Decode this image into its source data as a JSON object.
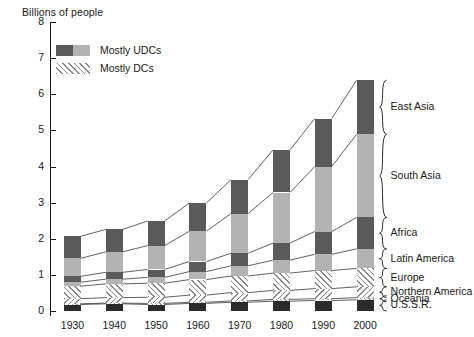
{
  "chart_data": {
    "type": "bar",
    "title": "",
    "ylabel": "Billions of people",
    "xlabel": "",
    "ylim": [
      0,
      8
    ],
    "yticks": [
      0,
      1,
      2,
      3,
      4,
      5,
      6,
      7,
      8
    ],
    "grid": false,
    "stacked": true,
    "categories": [
      "1930",
      "1940",
      "1950",
      "1960",
      "1970",
      "1980",
      "1990",
      "2000"
    ],
    "legend": {
      "position": "upper-left",
      "entries": [
        {
          "label": "Mostly UDCs",
          "swatch": "dark-light-gray"
        },
        {
          "label": "Mostly DCs",
          "swatch": "diagonal-hatch"
        }
      ]
    },
    "series": [
      {
        "name": "U.S.S.R.",
        "group": "Mostly DCs",
        "fill": "solid-thin",
        "values": [
          0.18,
          0.2,
          0.18,
          0.21,
          0.24,
          0.27,
          0.29,
          0.31
        ]
      },
      {
        "name": "Oceania",
        "group": "Mostly DCs",
        "fill": "hatch-fine",
        "values": [
          0.02,
          0.02,
          0.03,
          0.03,
          0.04,
          0.05,
          0.05,
          0.06
        ]
      },
      {
        "name": "Northern America",
        "group": "Mostly DCs",
        "fill": "hatch-reverse",
        "values": [
          0.14,
          0.15,
          0.17,
          0.2,
          0.23,
          0.25,
          0.28,
          0.3
        ]
      },
      {
        "name": "Europe",
        "group": "Mostly DCs",
        "fill": "hatch",
        "values": [
          0.35,
          0.38,
          0.39,
          0.43,
          0.46,
          0.48,
          0.5,
          0.51
        ]
      },
      {
        "name": "Latin America",
        "group": "Mostly UDCs",
        "fill": "light-gray",
        "values": [
          0.11,
          0.13,
          0.16,
          0.22,
          0.28,
          0.36,
          0.45,
          0.54
        ]
      },
      {
        "name": "Africa",
        "group": "Mostly UDCs",
        "fill": "dark-gray",
        "values": [
          0.16,
          0.19,
          0.22,
          0.28,
          0.35,
          0.47,
          0.63,
          0.87
        ]
      },
      {
        "name": "South Asia",
        "group": "Mostly UDCs",
        "fill": "light-gray",
        "values": [
          0.5,
          0.57,
          0.66,
          0.84,
          1.1,
          1.4,
          1.8,
          2.3
        ]
      },
      {
        "name": "East Asia",
        "group": "Mostly UDCs",
        "fill": "dark-gray",
        "values": [
          0.61,
          0.62,
          0.68,
          0.78,
          0.94,
          1.18,
          1.33,
          1.5
        ]
      }
    ],
    "totals": [
      2.07,
      2.26,
      2.49,
      2.99,
      3.64,
      4.46,
      5.33,
      6.39
    ],
    "annotations": [
      "Each stacked bar is subdivided by world region",
      "Thin connector lines join corresponding segment boundaries between bars",
      "Curly braces at right group the 2000 bar segments to region labels"
    ]
  },
  "right_labels": [
    {
      "name": "East Asia"
    },
    {
      "name": "South Asia"
    },
    {
      "name": "Africa"
    },
    {
      "name": "Latin America"
    },
    {
      "name": "Europe"
    },
    {
      "name": "Northern America"
    },
    {
      "name": "Oceania"
    },
    {
      "name": "U.S.S.R."
    }
  ]
}
